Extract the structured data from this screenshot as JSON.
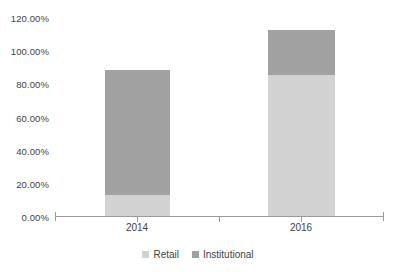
{
  "chart_data": {
    "type": "bar",
    "subtype": "stacked-column",
    "title": "",
    "xlabel": "",
    "ylabel": "",
    "categories": [
      "2014",
      "2016"
    ],
    "series": [
      {
        "name": "Retail",
        "color": "#d2d2d2",
        "values": [
          13.0,
          85.8
        ]
      },
      {
        "name": "Institutional",
        "color": "#a1a1a1",
        "values": [
          75.9,
          26.9
        ]
      }
    ],
    "totals": [
      88.9,
      112.7
    ],
    "ylim": [
      0,
      120
    ],
    "ytick_step": 20,
    "ytick_labels": [
      "0.00%",
      "20.00%",
      "40.00%",
      "60.00%",
      "80.00%",
      "100.00%",
      "120.00%"
    ],
    "ytick_values": [
      0,
      20,
      40,
      60,
      80,
      100,
      120
    ],
    "value_format": "percent",
    "grid": false,
    "legend_position": "bottom",
    "legend_entries": [
      "Retail",
      "Institutional"
    ],
    "axis_color": "#9a9a9a",
    "text_color": "#3f3f3f",
    "background": "#ffffff"
  }
}
